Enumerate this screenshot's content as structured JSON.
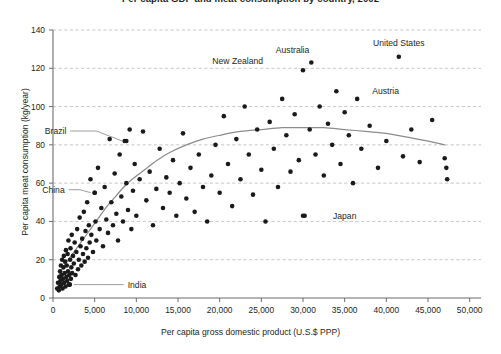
{
  "chart_data": {
    "type": "scatter",
    "title": "Per capita GDP and meat consumption by country, 2002",
    "xlabel": "Per capita gross domestic product (U.S.$ PPP)",
    "ylabel": "Per capita meat consumption (kg/year)",
    "xlim": [
      0,
      51000
    ],
    "ylim": [
      0,
      140
    ],
    "xticks": [
      0,
      5000,
      10000,
      15000,
      20000,
      25000,
      30000,
      35000,
      40000,
      45000,
      50000
    ],
    "xticklabels": [
      "0",
      "5,000",
      "10,000",
      "15,000",
      "20,000",
      "25,000",
      "30,000",
      "35,000",
      "40,000",
      "45,000",
      "50,000"
    ],
    "yticks": [
      0,
      20,
      40,
      60,
      80,
      100,
      120,
      140
    ],
    "yticklabels": [
      "0",
      "20",
      "40",
      "60",
      "80",
      "100",
      "120",
      "140"
    ],
    "grid": "horizontal-dashed",
    "legend": "none",
    "marker_color": "#1a1a1a",
    "marker_size": 2.3,
    "trend_color": "#8c8c8c",
    "grid_color": "#b9b9b9",
    "axis_color": "#6d6d6d",
    "points": [
      [
        500,
        5
      ],
      [
        600,
        8
      ],
      [
        700,
        4
      ],
      [
        750,
        11
      ],
      [
        800,
        6
      ],
      [
        850,
        14
      ],
      [
        900,
        9
      ],
      [
        950,
        17
      ],
      [
        1000,
        7
      ],
      [
        1050,
        12
      ],
      [
        1100,
        20
      ],
      [
        1150,
        5
      ],
      [
        1200,
        10
      ],
      [
        1250,
        16
      ],
      [
        1300,
        22
      ],
      [
        1350,
        8
      ],
      [
        1400,
        13
      ],
      [
        1450,
        19
      ],
      [
        1500,
        6
      ],
      [
        1550,
        25
      ],
      [
        1600,
        11
      ],
      [
        1650,
        17
      ],
      [
        1700,
        9
      ],
      [
        1750,
        23
      ],
      [
        1800,
        14
      ],
      [
        1850,
        30
      ],
      [
        1900,
        7
      ],
      [
        1950,
        12
      ],
      [
        2000,
        7
      ],
      [
        2050,
        20
      ],
      [
        2100,
        26
      ],
      [
        2150,
        10
      ],
      [
        2200,
        16
      ],
      [
        2250,
        33
      ],
      [
        2300,
        13
      ],
      [
        2400,
        22
      ],
      [
        2500,
        18
      ],
      [
        2600,
        29
      ],
      [
        2700,
        12
      ],
      [
        2800,
        24
      ],
      [
        2900,
        36
      ],
      [
        3000,
        15
      ],
      [
        3100,
        20
      ],
      [
        3200,
        42
      ],
      [
        3300,
        27
      ],
      [
        3400,
        17
      ],
      [
        3500,
        31
      ],
      [
        3600,
        23
      ],
      [
        3700,
        45
      ],
      [
        3800,
        19
      ],
      [
        3900,
        35
      ],
      [
        4000,
        26
      ],
      [
        4100,
        50
      ],
      [
        4200,
        21
      ],
      [
        4300,
        38
      ],
      [
        4400,
        29
      ],
      [
        4500,
        62
      ],
      [
        4600,
        33
      ],
      [
        4800,
        24
      ],
      [
        5000,
        55
      ],
      [
        5100,
        40
      ],
      [
        5200,
        30
      ],
      [
        5400,
        68
      ],
      [
        5600,
        36
      ],
      [
        5800,
        47
      ],
      [
        6000,
        27
      ],
      [
        6200,
        58
      ],
      [
        6400,
        41
      ],
      [
        6600,
        34
      ],
      [
        6800,
        83
      ],
      [
        7000,
        50
      ],
      [
        7200,
        38
      ],
      [
        7400,
        65
      ],
      [
        7600,
        44
      ],
      [
        7800,
        30
      ],
      [
        8000,
        75
      ],
      [
        8200,
        53
      ],
      [
        8400,
        40
      ],
      [
        8600,
        82
      ],
      [
        8800,
        60
      ],
      [
        9000,
        46
      ],
      [
        9200,
        88
      ],
      [
        9400,
        36
      ],
      [
        9600,
        56
      ],
      [
        9800,
        70
      ],
      [
        10000,
        43
      ],
      [
        10400,
        62
      ],
      [
        10800,
        87
      ],
      [
        11200,
        51
      ],
      [
        11600,
        66
      ],
      [
        12000,
        38
      ],
      [
        12400,
        57
      ],
      [
        12800,
        78
      ],
      [
        13200,
        47
      ],
      [
        13600,
        63
      ],
      [
        14000,
        55
      ],
      [
        14400,
        72
      ],
      [
        14800,
        43
      ],
      [
        15200,
        60
      ],
      [
        15600,
        86
      ],
      [
        16000,
        52
      ],
      [
        16500,
        68
      ],
      [
        17000,
        45
      ],
      [
        17500,
        75
      ],
      [
        18000,
        58
      ],
      [
        18500,
        40
      ],
      [
        19000,
        64
      ],
      [
        19500,
        80
      ],
      [
        20000,
        55
      ],
      [
        20500,
        95
      ],
      [
        21000,
        70
      ],
      [
        21500,
        48
      ],
      [
        22000,
        83
      ],
      [
        22500,
        62
      ],
      [
        23000,
        100
      ],
      [
        23500,
        75
      ],
      [
        24000,
        54
      ],
      [
        24500,
        88
      ],
      [
        25000,
        67
      ],
      [
        25500,
        40
      ],
      [
        26000,
        92
      ],
      [
        26500,
        78
      ],
      [
        27000,
        58
      ],
      [
        27500,
        104
      ],
      [
        28000,
        85
      ],
      [
        28500,
        66
      ],
      [
        29000,
        96
      ],
      [
        29500,
        72
      ],
      [
        30000,
        119
      ],
      [
        30200,
        43
      ],
      [
        30800,
        88
      ],
      [
        31000,
        123
      ],
      [
        31500,
        75
      ],
      [
        32000,
        100
      ],
      [
        32500,
        64
      ],
      [
        33000,
        91
      ],
      [
        33500,
        80
      ],
      [
        34000,
        108
      ],
      [
        34500,
        70
      ],
      [
        35000,
        97
      ],
      [
        35500,
        85
      ],
      [
        36000,
        60
      ],
      [
        36500,
        104
      ],
      [
        37000,
        78
      ],
      [
        38000,
        90
      ],
      [
        39000,
        68
      ],
      [
        40000,
        82
      ],
      [
        41500,
        126
      ],
      [
        42000,
        74
      ],
      [
        43000,
        88
      ],
      [
        44000,
        71
      ],
      [
        45500,
        93
      ],
      [
        47000,
        73
      ],
      [
        47200,
        68
      ],
      [
        47300,
        62
      ],
      [
        30000,
        43
      ],
      [
        8800,
        82
      ],
      [
        5000,
        55
      ],
      [
        2000,
        7
      ]
    ],
    "trend_line": [
      [
        700,
        12
      ],
      [
        1500,
        18
      ],
      [
        2500,
        24
      ],
      [
        3500,
        30
      ],
      [
        4500,
        36
      ],
      [
        5500,
        42
      ],
      [
        6500,
        48
      ],
      [
        7500,
        53
      ],
      [
        8500,
        58
      ],
      [
        9500,
        62
      ],
      [
        11000,
        67
      ],
      [
        12500,
        72
      ],
      [
        14000,
        76
      ],
      [
        16000,
        80
      ],
      [
        18000,
        83
      ],
      [
        20000,
        85
      ],
      [
        22500,
        87
      ],
      [
        25000,
        88
      ],
      [
        27500,
        89
      ],
      [
        30000,
        89
      ],
      [
        32500,
        89
      ],
      [
        35000,
        88
      ],
      [
        37500,
        87
      ],
      [
        40000,
        86
      ],
      [
        42500,
        84
      ],
      [
        45000,
        82
      ],
      [
        47000,
        80
      ]
    ],
    "annotations": [
      {
        "name": "united-states",
        "label": "United States",
        "x": 41500,
        "y": 126,
        "label_dx": 0,
        "label_dy": 14,
        "leader": false
      },
      {
        "name": "australia",
        "label": "Australia",
        "x": 31000,
        "y": 123,
        "label_dx": -2,
        "label_dy": 13,
        "leader": false
      },
      {
        "name": "austria",
        "label": "Austria",
        "x": 34000,
        "y": 108,
        "label_dx": 36,
        "label_dy": 0,
        "leader": false
      },
      {
        "name": "new-zealand",
        "label": "New Zealand",
        "x": 30000,
        "y": 119,
        "label_dx": -40,
        "label_dy": 9,
        "leader": false
      },
      {
        "name": "brazil",
        "label": "Brazil",
        "x": 8800,
        "y": 82,
        "label_dx": -60,
        "label_dy": 10,
        "leader": true
      },
      {
        "name": "china",
        "label": "China",
        "x": 5000,
        "y": 55,
        "label_dx": -30,
        "label_dy": 3,
        "leader": true
      },
      {
        "name": "japan",
        "label": "Japan",
        "x": 30000,
        "y": 43,
        "label_dx": 30,
        "label_dy": 0,
        "leader": false
      },
      {
        "name": "india",
        "label": "India",
        "x": 2000,
        "y": 7,
        "label_dx": 58,
        "label_dy": 0,
        "leader": true
      }
    ]
  }
}
